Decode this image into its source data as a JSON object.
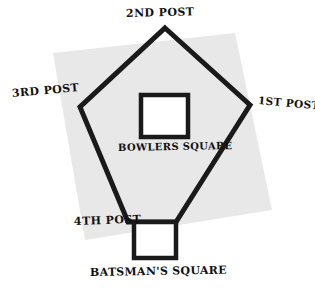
{
  "diagram": {
    "colors": {
      "background": "#ffffff",
      "ground_fill": "#e8e8e8",
      "ink": "#1a1a1a",
      "pitch_fill": "#ffffff"
    },
    "labels": {
      "post_2nd": "2ND POST",
      "post_3rd": "3RD POST",
      "post_1st": "1ST POST",
      "post_4th": "4TH POST",
      "bowlers_square": "BOWLERS SQUARE",
      "batsmans_square": "BATSMAN'S SQUARE"
    },
    "shapes": {
      "ground_square": {
        "name": "ground-square",
        "points": "53,53 235,33 272,210 85,240"
      },
      "field_pentagon": {
        "name": "field-pentagon",
        "points": "165,28 250,105 176,222 128,222 80,107"
      },
      "bowlers_square": {
        "name": "bowlers-square-outline",
        "x": 141,
        "y": 95,
        "width": 47,
        "height": 42
      },
      "batsmans_square": {
        "name": "batsmans-square-outline",
        "x": 134,
        "y": 222,
        "width": 42,
        "height": 36
      }
    }
  }
}
